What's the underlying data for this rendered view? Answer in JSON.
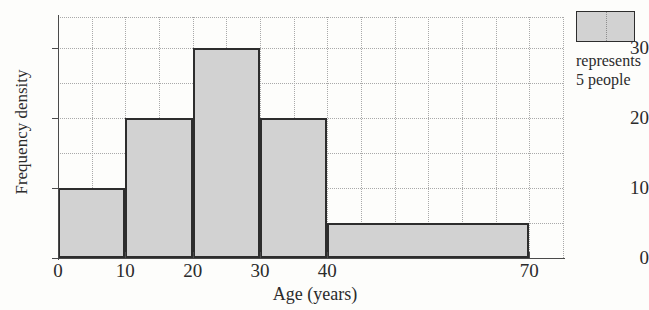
{
  "chart_data": {
    "type": "bar",
    "title": "",
    "xlabel": "Age (years)",
    "ylabel": "Frequency density",
    "xlim": [
      0,
      75
    ],
    "ylim": [
      0,
      34.5
    ],
    "grid": true,
    "grid_step_x": 5,
    "grid_step_y": 5,
    "x_ticks": [
      {
        "value": 0,
        "label": "0"
      },
      {
        "value": 10,
        "label": "10"
      },
      {
        "value": 20,
        "label": "20"
      },
      {
        "value": 30,
        "label": "30"
      },
      {
        "value": 40,
        "label": "40"
      },
      {
        "value": 70,
        "label": "70"
      }
    ],
    "y_ticks": [
      {
        "value": 0,
        "label": "0"
      },
      {
        "value": 10,
        "label": "10"
      },
      {
        "value": 20,
        "label": "20"
      },
      {
        "value": 30,
        "label": "30"
      }
    ],
    "bins": [
      {
        "label": "0-10",
        "x_start": 0,
        "x_end": 10,
        "frequency_density": 10
      },
      {
        "label": "10-20",
        "x_start": 10,
        "x_end": 20,
        "frequency_density": 20
      },
      {
        "label": "20-30",
        "x_start": 20,
        "x_end": 30,
        "frequency_density": 30
      },
      {
        "label": "30-40",
        "x_start": 30,
        "x_end": 40,
        "frequency_density": 20
      },
      {
        "label": "40-70",
        "x_start": 40,
        "x_end": 70,
        "frequency_density": 5
      }
    ],
    "categories": [
      "0-10",
      "10-20",
      "20-30",
      "30-40",
      "40-70"
    ],
    "values": [
      10,
      20,
      30,
      20,
      5
    ],
    "colors": {
      "bar_fill": "#d2d2d2",
      "bar_border": "#2d2d2d",
      "axis": "#4a4a4a",
      "grid": "#a9a9a9",
      "background": "#fdfdfb",
      "text": "#2b2b2b"
    }
  },
  "legend": {
    "swatch_label": "",
    "line1": "represents",
    "line2": "5 people"
  }
}
